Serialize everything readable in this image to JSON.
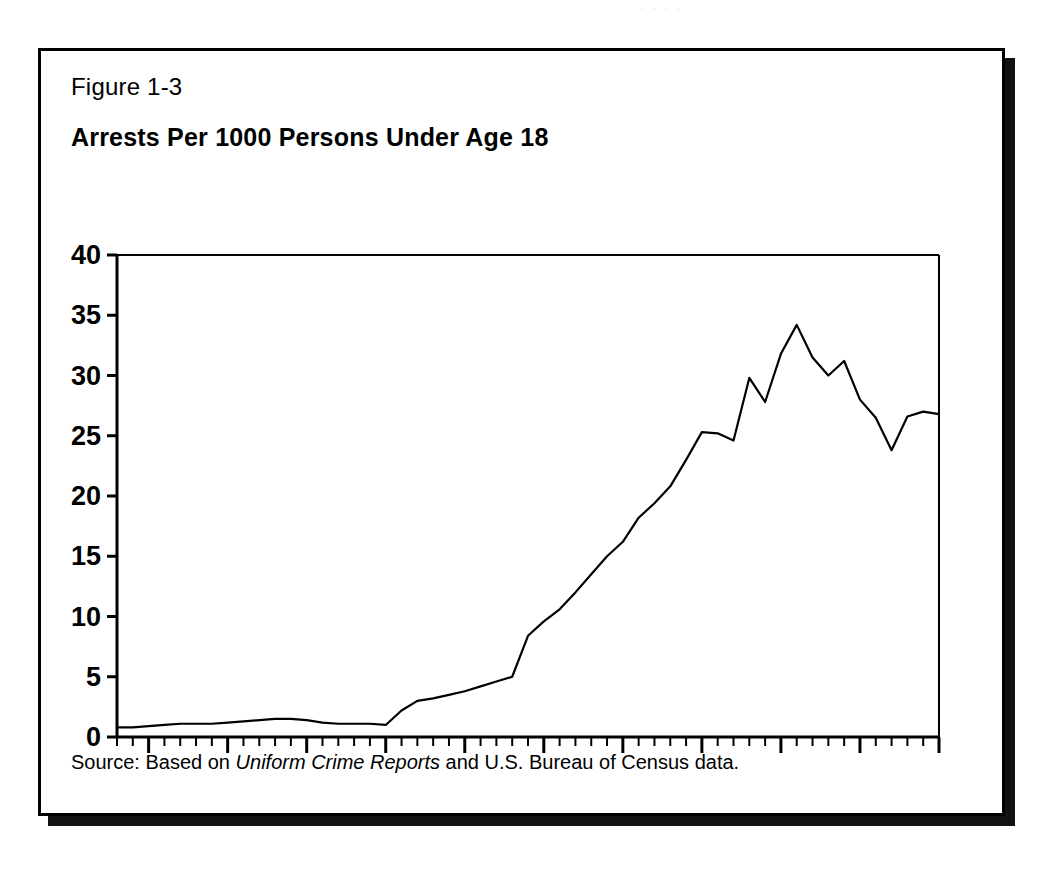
{
  "page": {
    "background": "#ffffff",
    "ink_color": "#000000",
    "scan_artifact_text": "·  ·   ·    ·"
  },
  "figure": {
    "label": "Figure 1-3",
    "title": "Arrests Per 1000 Persons Under Age 18",
    "source_prefix": "Source: Based on ",
    "source_italic": "Uniform Crime Reports",
    "source_suffix": " and U.S. Bureau of Census data.",
    "border_color": "#000000",
    "shadow_color": "#111111"
  },
  "chart_data": {
    "type": "line",
    "title": "Arrests Per 1000 Persons Under Age 18",
    "xlabel": "",
    "ylabel": "",
    "xlim": [
      1933,
      1985
    ],
    "ylim": [
      0,
      40
    ],
    "ytick_values": [
      0,
      5,
      10,
      15,
      20,
      25,
      30,
      35,
      40
    ],
    "ytick_labels": [
      "0",
      "5",
      "10",
      "15",
      "20",
      "25",
      "30",
      "35",
      "40"
    ],
    "xtick_values": [
      1935,
      1940,
      1945,
      1950,
      1955,
      1960,
      1965,
      1970,
      1975,
      1980,
      1985
    ],
    "xtick_labels": [
      "1935",
      "1940",
      "1945",
      "1950",
      "1955",
      "1960",
      "1965",
      "1970",
      "1975",
      "1980",
      "1985"
    ],
    "minor_xtick_interval": 1,
    "grid": false,
    "legend": null,
    "line_color": "#000000",
    "line_width": 2.2,
    "x": [
      1933,
      1934,
      1935,
      1936,
      1937,
      1938,
      1939,
      1940,
      1941,
      1942,
      1943,
      1944,
      1945,
      1946,
      1947,
      1948,
      1949,
      1950,
      1951,
      1952,
      1953,
      1954,
      1955,
      1956,
      1957,
      1958,
      1959,
      1960,
      1961,
      1962,
      1963,
      1964,
      1965,
      1966,
      1967,
      1968,
      1969,
      1970,
      1971,
      1972,
      1973,
      1974,
      1975,
      1976,
      1977,
      1978,
      1979,
      1980,
      1981,
      1982,
      1983,
      1984,
      1985
    ],
    "values": [
      0.8,
      0.8,
      0.9,
      1.0,
      1.1,
      1.1,
      1.1,
      1.2,
      1.3,
      1.4,
      1.5,
      1.5,
      1.4,
      1.2,
      1.1,
      1.1,
      1.1,
      1.0,
      2.2,
      3.0,
      3.2,
      3.5,
      3.8,
      4.2,
      4.6,
      5.0,
      8.4,
      9.6,
      10.6,
      12.0,
      13.5,
      15.0,
      16.2,
      18.2,
      19.4,
      20.8,
      23.0,
      25.3,
      25.2,
      24.6,
      29.8,
      27.8,
      31.8,
      34.2,
      31.5,
      30.0,
      31.2,
      28.0,
      26.5,
      23.8,
      26.6,
      27.0,
      26.8
    ],
    "series_name": "Arrests per 1000 persons under age 18"
  },
  "axes": {
    "y_axis_name": "y-axis",
    "x_axis_name": "x-axis",
    "top_rule": true,
    "right_rule": true
  }
}
